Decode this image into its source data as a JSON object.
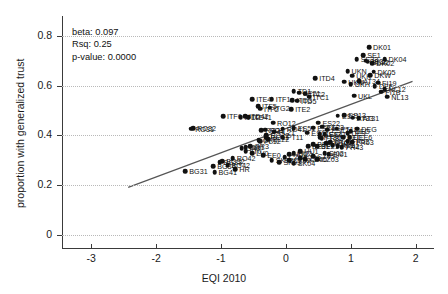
{
  "chart_data": {
    "type": "scatter",
    "title": "",
    "xlabel": "EQI 2010",
    "ylabel": "proportion with generalized trust",
    "xlim": [
      -3.45,
      2.25
    ],
    "ylim": [
      -0.035,
      0.855
    ],
    "xticks": [
      -3,
      -2,
      -1,
      0,
      1,
      2
    ],
    "xticklabels": [
      "-3",
      "-2",
      "-1",
      "0",
      "1",
      "2"
    ],
    "yticks": [
      0,
      0.2,
      0.4,
      0.6,
      0.8
    ],
    "yticklabels": [
      "0",
      "0.2",
      "0.4",
      "0.6",
      "0.8"
    ],
    "grid": "horizontal-dotted",
    "legend": "none",
    "annotations": {
      "beta": "beta: 0.097",
      "rsq": "Rsq: 0.25",
      "pvalue": "p-value: 0.0000"
    },
    "fit_line": {
      "type": "linear",
      "slope": 0.097,
      "intercept": 0.428,
      "x_start": -2.43,
      "x_end": 1.95,
      "y_start": 0.192,
      "y_end": 0.617
    },
    "point_color": "#111111",
    "line_color": "#555555",
    "points": [
      {
        "label": "DK01",
        "x": 1.28,
        "y": 0.755
      },
      {
        "label": "SE1",
        "x": 1.19,
        "y": 0.722
      },
      {
        "label": "DK04",
        "x": 1.52,
        "y": 0.705
      },
      {
        "label": "SE33",
        "x": 1.09,
        "y": 0.706
      },
      {
        "label": "SE32",
        "x": 1.23,
        "y": 0.7
      },
      {
        "label": "DK02",
        "x": 1.33,
        "y": 0.69
      },
      {
        "label": "SE22",
        "x": 1.26,
        "y": 0.696
      },
      {
        "label": "UKN",
        "x": 0.95,
        "y": 0.658
      },
      {
        "label": "DK05",
        "x": 1.35,
        "y": 0.655
      },
      {
        "label": "UKK",
        "x": 1.02,
        "y": 0.64
      },
      {
        "label": "DKW",
        "x": 1.3,
        "y": 0.641
      },
      {
        "label": "ITD4",
        "x": 0.45,
        "y": 0.63
      },
      {
        "label": "UKM",
        "x": 0.9,
        "y": 0.615
      },
      {
        "label": "AT34",
        "x": 1.13,
        "y": 0.617
      },
      {
        "label": "FI19",
        "x": 1.42,
        "y": 0.612
      },
      {
        "label": "UKH",
        "x": 1.0,
        "y": 0.606
      },
      {
        "label": "DEF",
        "x": 1.37,
        "y": 0.598
      },
      {
        "label": "NL12",
        "x": 1.52,
        "y": 0.586
      },
      {
        "label": "FI1B",
        "x": 1.47,
        "y": 0.575
      },
      {
        "label": "TD1",
        "x": 0.12,
        "y": 0.578
      },
      {
        "label": "SE21",
        "x": 0.2,
        "y": 0.572
      },
      {
        "label": "ITC2",
        "x": 0.3,
        "y": 0.568
      },
      {
        "label": "ITC1",
        "x": 0.36,
        "y": 0.555
      },
      {
        "label": "ITE4",
        "x": -0.52,
        "y": 0.545
      },
      {
        "label": "ITF1",
        "x": -0.22,
        "y": 0.545
      },
      {
        "label": "ITD3",
        "x": 0.1,
        "y": 0.542
      },
      {
        "label": "ITD5",
        "x": 0.17,
        "y": 0.54
      },
      {
        "label": "NL13",
        "x": 1.56,
        "y": 0.555
      },
      {
        "label": "UKL",
        "x": 1.05,
        "y": 0.56
      },
      {
        "label": "ITF5",
        "x": -0.43,
        "y": 0.518
      },
      {
        "label": "ITF2",
        "x": -0.4,
        "y": 0.508
      },
      {
        "label": "ITG2",
        "x": -0.25,
        "y": 0.512
      },
      {
        "label": "ITE2",
        "x": 0.08,
        "y": 0.505
      },
      {
        "label": "ITF6",
        "x": -0.97,
        "y": 0.478
      },
      {
        "label": "ITD42",
        "x": -0.63,
        "y": 0.477
      },
      {
        "label": "ITD2",
        "x": -0.7,
        "y": 0.474
      },
      {
        "label": "ITD41",
        "x": -0.58,
        "y": 0.474
      },
      {
        "label": "RO32",
        "x": -1.43,
        "y": 0.43
      },
      {
        "label": "RO31",
        "x": -1.46,
        "y": 0.428
      },
      {
        "label": "RO12",
        "x": -0.2,
        "y": 0.452
      },
      {
        "label": "RO41",
        "x": -0.05,
        "y": 0.427
      },
      {
        "label": "RO3",
        "x": -0.32,
        "y": 0.424
      },
      {
        "label": "RO21",
        "x": -0.38,
        "y": 0.422
      },
      {
        "label": "RO22",
        "x": -0.3,
        "y": 0.4
      },
      {
        "label": "ES51",
        "x": 0.12,
        "y": 0.43
      },
      {
        "label": "ES61",
        "x": 0.33,
        "y": 0.412
      },
      {
        "label": "ES22",
        "x": 0.5,
        "y": 0.452
      },
      {
        "label": "ES24",
        "x": 0.42,
        "y": 0.432
      },
      {
        "label": "ES23",
        "x": 0.56,
        "y": 0.436
      },
      {
        "label": "ES12",
        "x": 0.64,
        "y": 0.424
      },
      {
        "label": "ES21",
        "x": 0.8,
        "y": 0.48
      },
      {
        "label": "ES13",
        "x": 0.9,
        "y": 0.482
      },
      {
        "label": "ES43",
        "x": 0.52,
        "y": 0.406
      },
      {
        "label": "ES41",
        "x": 0.6,
        "y": 0.404
      },
      {
        "label": "AT33",
        "x": 1.03,
        "y": 0.472
      },
      {
        "label": "AT31",
        "x": 1.12,
        "y": 0.47
      },
      {
        "label": "PT18",
        "x": 0.78,
        "y": 0.428
      },
      {
        "label": "PT30",
        "x": 0.52,
        "y": 0.392
      },
      {
        "label": "PT11",
        "x": -0.05,
        "y": 0.392
      },
      {
        "label": "PL21",
        "x": -0.18,
        "y": 0.415
      },
      {
        "label": "PL22",
        "x": -0.27,
        "y": 0.386
      },
      {
        "label": "PL12",
        "x": -0.4,
        "y": 0.378
      },
      {
        "label": "DEG",
        "x": 1.1,
        "y": 0.428
      },
      {
        "label": "DED",
        "x": 1.0,
        "y": 0.418
      },
      {
        "label": "DE9",
        "x": 0.95,
        "y": 0.408
      },
      {
        "label": "DEE6",
        "x": 0.98,
        "y": 0.392
      },
      {
        "label": "DEC",
        "x": 0.88,
        "y": 0.392
      },
      {
        "label": "FR52",
        "x": 0.95,
        "y": 0.378
      },
      {
        "label": "FR53",
        "x": 1.02,
        "y": 0.372
      },
      {
        "label": "FR61",
        "x": 0.68,
        "y": 0.374
      },
      {
        "label": "FR82",
        "x": 0.55,
        "y": 0.388
      },
      {
        "label": "FR10",
        "x": 0.62,
        "y": 0.368
      },
      {
        "label": "FR71",
        "x": 0.72,
        "y": 0.36
      },
      {
        "label": "FR42",
        "x": 0.8,
        "y": 0.356
      },
      {
        "label": "FR43",
        "x": 0.86,
        "y": 0.354
      },
      {
        "label": "BE3",
        "x": 0.42,
        "y": 0.366
      },
      {
        "label": "BE21",
        "x": 0.48,
        "y": 0.358
      },
      {
        "label": "BE31",
        "x": 0.34,
        "y": 0.358
      },
      {
        "label": "GR4",
        "x": -0.42,
        "y": 0.38
      },
      {
        "label": "GR3",
        "x": -0.55,
        "y": 0.356
      },
      {
        "label": "GR1",
        "x": -0.62,
        "y": 0.352
      },
      {
        "label": "GR2",
        "x": -0.68,
        "y": 0.348
      },
      {
        "label": "RO11",
        "x": -0.3,
        "y": 0.392
      },
      {
        "label": "HU1",
        "x": 0.22,
        "y": 0.336
      },
      {
        "label": "HU2",
        "x": 0.12,
        "y": 0.33
      },
      {
        "label": "HU3",
        "x": 0.05,
        "y": 0.326
      },
      {
        "label": "CZ05",
        "x": 0.42,
        "y": 0.318
      },
      {
        "label": "CZ03",
        "x": 0.48,
        "y": 0.306
      },
      {
        "label": "CZ06",
        "x": 0.3,
        "y": 0.306
      },
      {
        "label": "CZ01",
        "x": 0.22,
        "y": 0.308
      },
      {
        "label": "CZ02",
        "x": 0.05,
        "y": 0.302
      },
      {
        "label": "CZ04",
        "x": -0.02,
        "y": 0.312
      },
      {
        "label": "SK04",
        "x": 0.12,
        "y": 0.288
      },
      {
        "label": "SK03",
        "x": -0.1,
        "y": 0.294
      },
      {
        "label": "SK02",
        "x": -0.22,
        "y": 0.3
      },
      {
        "label": "SI02",
        "x": 0.6,
        "y": 0.33
      },
      {
        "label": "SI01",
        "x": 0.66,
        "y": 0.324
      },
      {
        "label": "LT0",
        "x": -0.62,
        "y": 0.336
      },
      {
        "label": "LV0",
        "x": -0.52,
        "y": 0.33
      },
      {
        "label": "EE0",
        "x": -0.35,
        "y": 0.32
      },
      {
        "label": "BG31",
        "x": -1.55,
        "y": 0.258
      },
      {
        "label": "BG41",
        "x": -1.1,
        "y": 0.252
      },
      {
        "label": "BG32",
        "x": -0.98,
        "y": 0.298
      },
      {
        "label": "BG33",
        "x": -1.02,
        "y": 0.294
      },
      {
        "label": "BG34",
        "x": -1.12,
        "y": 0.278
      },
      {
        "label": "BG42",
        "x": -0.9,
        "y": 0.282
      },
      {
        "label": "HR",
        "x": -0.78,
        "y": 0.264
      },
      {
        "label": "RO42",
        "x": -0.82,
        "y": 0.308
      }
    ]
  }
}
